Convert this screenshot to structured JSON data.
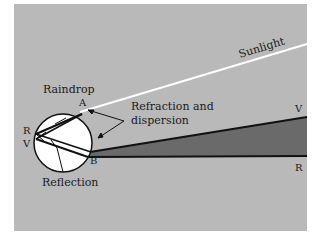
{
  "diagram": {
    "colors": {
      "panel": "#b9b9b9",
      "drop": "#ffffff",
      "spectrum_band": "#6a6a6a",
      "line": "#111111",
      "sunlight": "#ffffff"
    },
    "labels": {
      "sunlight": "Sunlight",
      "raindrop": "Raindrop",
      "point_a": "A",
      "point_b": "B",
      "refraction_line1": "Refraction and",
      "refraction_line2": "dispersion",
      "reflection": "Reflection",
      "r_left": "R",
      "v_left": "V",
      "v_right": "V",
      "r_right": "R"
    }
  }
}
